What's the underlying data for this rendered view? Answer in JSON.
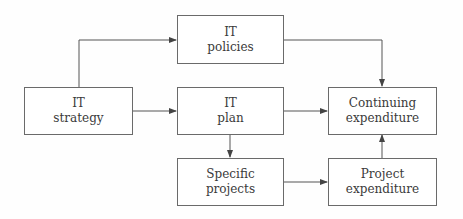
{
  "diagram": {
    "type": "flowchart",
    "nodes": [
      {
        "id": "it_policies",
        "line1": "IT",
        "line2": "policies"
      },
      {
        "id": "it_strategy",
        "line1": "IT",
        "line2": "strategy"
      },
      {
        "id": "it_plan",
        "line1": "IT",
        "line2": "plan"
      },
      {
        "id": "continuing_expenditure",
        "line1": "Continuing",
        "line2": "expenditure"
      },
      {
        "id": "specific_projects",
        "line1": "Specific",
        "line2": "projects"
      },
      {
        "id": "project_expenditure",
        "line1": "Project",
        "line2": "expenditure"
      }
    ],
    "edges": [
      {
        "from": "it_strategy",
        "to": "it_policies"
      },
      {
        "from": "it_strategy",
        "to": "it_plan"
      },
      {
        "from": "it_policies",
        "to": "continuing_expenditure"
      },
      {
        "from": "it_plan",
        "to": "continuing_expenditure"
      },
      {
        "from": "it_plan",
        "to": "specific_projects"
      },
      {
        "from": "specific_projects",
        "to": "project_expenditure"
      },
      {
        "from": "project_expenditure",
        "to": "continuing_expenditure"
      }
    ],
    "colors": {
      "line": "#555555",
      "border": "#6a6a6a",
      "text": "#3a3a3a"
    }
  }
}
